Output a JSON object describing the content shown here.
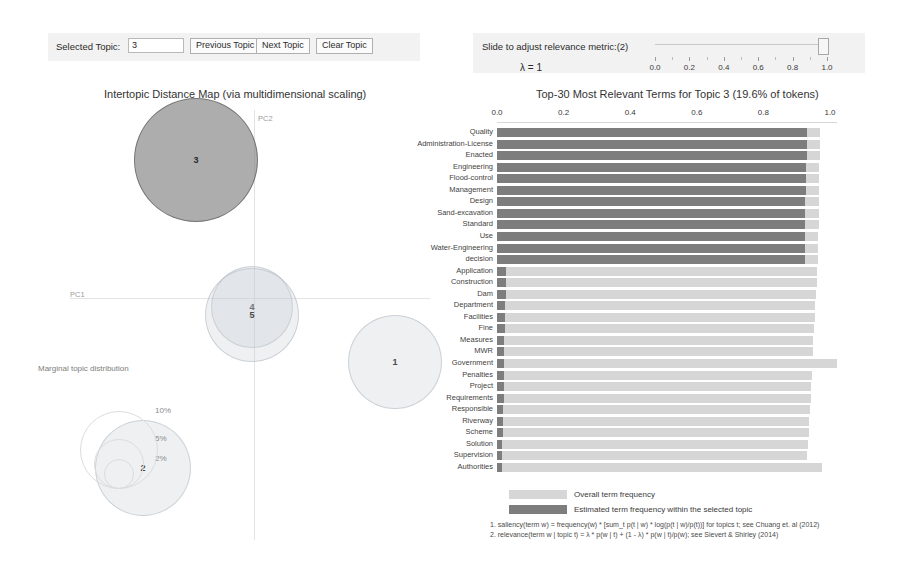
{
  "controls": {
    "selected_topic_label": "Selected Topic:",
    "selected_topic_value": "3",
    "previous_topic": "Previous Topic",
    "next_topic": "Next Topic",
    "clear_topic": "Clear Topic"
  },
  "slider": {
    "caption": "Slide to adjust relevance metric:(2)",
    "lambda_text": "λ = 1",
    "value": 1.0,
    "ticks": [
      "0.0",
      "0.2",
      "0.4",
      "0.6",
      "0.8",
      "1.0"
    ]
  },
  "left_panel": {
    "title": "Intertopic Distance Map (via multidimensional scaling)",
    "x_axis_label": "PC1",
    "y_axis_label": "PC2",
    "marginal_caption": "Marginal topic distribution",
    "marginal_sizes": [
      "2%",
      "5%",
      "10%"
    ],
    "topics": [
      {
        "id": "3",
        "cx": 156,
        "cy": 60,
        "r": 62,
        "selected": true
      },
      {
        "id": "4",
        "cx": 212,
        "cy": 207,
        "r": 41,
        "selected": false
      },
      {
        "id": "5",
        "cx": 212,
        "cy": 215,
        "r": 47,
        "selected": false
      },
      {
        "id": "1",
        "cx": 355,
        "cy": 262,
        "r": 47,
        "selected": false
      },
      {
        "id": "2",
        "cx": 103,
        "cy": 368,
        "r": 48,
        "selected": false
      }
    ]
  },
  "right_panel": {
    "title": "Top-30 Most Relevant Terms for Topic 3 (19.6% of tokens)",
    "legend": {
      "overall": "Overall term frequency",
      "within_topic": "Estimated term frequency within the selected topic"
    },
    "footnotes": [
      "1. saliency(term w) = frequency(w) * [sum_t p(t | w) * log(p(t | w)/p(t))] for topics t; see Chuang et. al (2012)",
      "2. relevance(term w | topic t) = λ * p(w | t) + (1 - λ) * p(w | t)/p(w); see Sievert & Shirley (2014)"
    ]
  },
  "chart_data": {
    "type": "bar",
    "title": "Top-30 Most Relevant Terms for Topic 3 (19.6% of tokens)",
    "xlabel": "",
    "ylabel": "",
    "xlim": [
      0.0,
      1.05
    ],
    "xticks": [
      0.0,
      0.2,
      0.4,
      0.6,
      0.8,
      1.0
    ],
    "grid": false,
    "orientation": "horizontal",
    "legend_position": "bottom",
    "categories": [
      "Quality",
      "Administration-License",
      "Enacted",
      "Engineering",
      "Flood-control",
      "Management",
      "Design",
      "Sand-excavation",
      "Standard",
      "Use",
      "Water-Engineering",
      "decision",
      "Application",
      "Construction",
      "Dam",
      "Department",
      "Facilities",
      "Fine",
      "Measures",
      "MWR",
      "Government",
      "Penalties",
      "Project",
      "Requirements",
      "Responsible",
      "Riverway",
      "Scheme",
      "Solution",
      "Supervision",
      "Authorities"
    ],
    "series": [
      {
        "name": "Overall term frequency",
        "color": "#d6d6d6",
        "values": [
          0.97,
          0.97,
          0.97,
          0.968,
          0.968,
          0.968,
          0.966,
          0.966,
          0.966,
          0.964,
          0.964,
          0.964,
          0.962,
          0.96,
          0.958,
          0.956,
          0.954,
          0.952,
          0.95,
          0.948,
          1.02,
          0.946,
          0.944,
          0.942,
          0.94,
          0.938,
          0.936,
          0.934,
          0.932,
          0.975
        ]
      },
      {
        "name": "Estimated term frequency within the selected topic",
        "color": "#7d7d7d",
        "values": [
          0.93,
          0.93,
          0.93,
          0.928,
          0.928,
          0.928,
          0.926,
          0.926,
          0.926,
          0.924,
          0.924,
          0.924,
          0.028,
          0.026,
          0.026,
          0.024,
          0.024,
          0.024,
          0.022,
          0.022,
          0.022,
          0.02,
          0.02,
          0.02,
          0.018,
          0.018,
          0.018,
          0.016,
          0.016,
          0.016
        ]
      }
    ]
  }
}
